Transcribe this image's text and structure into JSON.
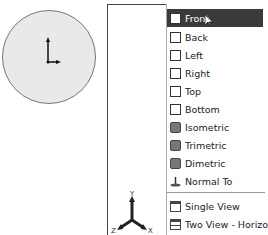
{
  "viewport_preview": {
    "shape": "circle",
    "triad": "origin-axes"
  },
  "menu": {
    "items": [
      {
        "label": "Front",
        "icon": "front-view-icon",
        "selected": true
      },
      {
        "label": "Back",
        "icon": "back-view-icon"
      },
      {
        "label": "Left",
        "icon": "left-view-icon"
      },
      {
        "label": "Right",
        "icon": "right-view-icon"
      },
      {
        "label": "Top",
        "icon": "top-view-icon"
      },
      {
        "label": "Bottom",
        "icon": "bottom-view-icon"
      },
      {
        "label": "Isometric",
        "icon": "isometric-icon"
      },
      {
        "label": "Trimetric",
        "icon": "trimetric-icon"
      },
      {
        "label": "Dimetric",
        "icon": "dimetric-icon"
      },
      {
        "label": "Normal To",
        "icon": "normal-to-icon"
      }
    ],
    "layout_items": [
      {
        "label": "Single View",
        "icon": "single-view-icon"
      },
      {
        "label": "Two View - Horizontal",
        "icon": "two-view-horizontal-icon"
      },
      {
        "label": "Two View - Vertical",
        "icon": "two-view-vertical-icon"
      },
      {
        "label": "Four View",
        "icon": "four-view-icon"
      }
    ]
  },
  "triad": {
    "x": "X",
    "y": "Y",
    "z": "Z"
  }
}
